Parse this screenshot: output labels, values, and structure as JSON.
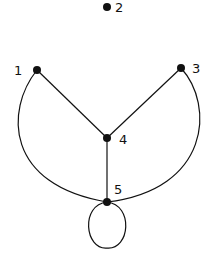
{
  "diagram": {
    "type": "graph",
    "nodes": [
      {
        "id": "1",
        "label": "1",
        "x": 37,
        "y": 70
      },
      {
        "id": "2",
        "label": "2",
        "x": 107,
        "y": 7
      },
      {
        "id": "3",
        "label": "3",
        "x": 181,
        "y": 68
      },
      {
        "id": "4",
        "label": "4",
        "x": 107,
        "y": 138
      },
      {
        "id": "5",
        "label": "5",
        "x": 107,
        "y": 202
      }
    ],
    "edges": [
      {
        "from": "1",
        "to": "4",
        "style": "straight"
      },
      {
        "from": "3",
        "to": "4",
        "style": "straight"
      },
      {
        "from": "4",
        "to": "5",
        "style": "straight"
      },
      {
        "from": "1",
        "to": "5",
        "style": "curved"
      },
      {
        "from": "3",
        "to": "5",
        "style": "curved"
      },
      {
        "from": "5",
        "to": "5",
        "style": "loop"
      }
    ],
    "colors": {
      "stroke": "#111111",
      "background": "#ffffff"
    }
  }
}
